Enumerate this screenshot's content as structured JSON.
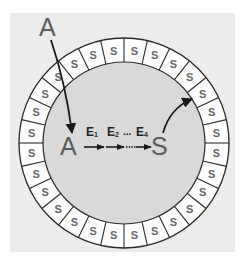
{
  "diagram": {
    "type": "circular membrane with translocation and enzymatic pathway",
    "colors": {
      "page_background": "#ffffff",
      "outer_square": "#ececec",
      "inner_disc": "#d9d9d9",
      "ring_cell": "#ffffff",
      "stroke": "#2a2a2a",
      "cell_text": "#666666",
      "label_text": "#5a5a5a"
    },
    "ring": {
      "cell_count": 28,
      "cell_label": "S"
    },
    "labels": {
      "outside_substrate": "A",
      "inside_substrate": "A",
      "product": "S",
      "enzymes": [
        {
          "letter": "E",
          "sub": "1"
        },
        {
          "letter": "E",
          "sub": "2"
        },
        {
          "letter": "E",
          "sub": "4"
        }
      ],
      "ellipsis": "..."
    },
    "arrows": [
      {
        "name": "uptake-arrow",
        "from": "outside A",
        "to": "inside A"
      },
      {
        "name": "step-arrow-1",
        "from": "A",
        "to": "E2"
      },
      {
        "name": "step-arrow-2",
        "from": "E2",
        "to": "E4"
      },
      {
        "name": "step-arrow-3",
        "from": "E4",
        "to": "S"
      },
      {
        "name": "incorporation-arrow",
        "from": "S",
        "to": "ring"
      }
    ]
  }
}
